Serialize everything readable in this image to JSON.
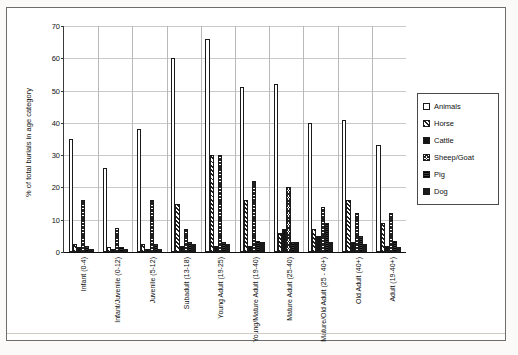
{
  "chart_data": {
    "type": "bar",
    "title": "",
    "xlabel": "",
    "ylabel": "% of total burials in age category",
    "ylim": [
      0,
      70
    ],
    "yticks": [
      0,
      10,
      20,
      30,
      40,
      50,
      60,
      70
    ],
    "grid": true,
    "legend_position": "right",
    "categories": [
      "Infant (0-4)",
      "Infant/Juvenile (0-12)",
      "Juvenile (5-12)",
      "Subadult (13-18)",
      "Young Adult (19-25)",
      "Young/Mature Adult (19-40)",
      "Mature Adult (25-40)",
      "Mature/Old Adult (25 - 40+)",
      "Old Adult (40+)",
      "Adult (19-40+)"
    ],
    "series": [
      {
        "name": "Animals",
        "values": [
          35,
          26,
          38,
          60,
          66,
          51,
          52,
          40,
          41,
          33
        ]
      },
      {
        "name": "Horse",
        "values": [
          2.5,
          1.5,
          2.5,
          15,
          30,
          16,
          6,
          7,
          16,
          9
        ]
      },
      {
        "name": "Cattle",
        "values": [
          1.5,
          1,
          1,
          2,
          2,
          2,
          7,
          5,
          3,
          2
        ]
      },
      {
        "name": "Sheep/Goat",
        "values": [
          16,
          7.5,
          16,
          7,
          30,
          22,
          20,
          14,
          12,
          12
        ]
      },
      {
        "name": "Pig",
        "values": [
          2,
          1.5,
          2.5,
          3,
          3,
          3.5,
          3,
          9,
          5,
          3.5
        ]
      },
      {
        "name": "Dog",
        "values": [
          1,
          0.8,
          1,
          2.5,
          2.5,
          3,
          3,
          3,
          2.5,
          1.5
        ]
      }
    ]
  },
  "legend": {
    "items": [
      {
        "label": "Animals",
        "swatch": "s-animals"
      },
      {
        "label": "Horse",
        "swatch": "s-horse"
      },
      {
        "label": "Cattle",
        "swatch": "s-cattle"
      },
      {
        "label": "Sheep/Goat",
        "swatch": "s-sheep"
      },
      {
        "label": "Pig",
        "swatch": "s-pig"
      },
      {
        "label": "Dog",
        "swatch": "s-dog"
      }
    ]
  },
  "colors": {
    "axis": "#111111",
    "grid": "#c9c9c9",
    "bar_outline": "#1a1a1a",
    "page": "#ffffff"
  }
}
